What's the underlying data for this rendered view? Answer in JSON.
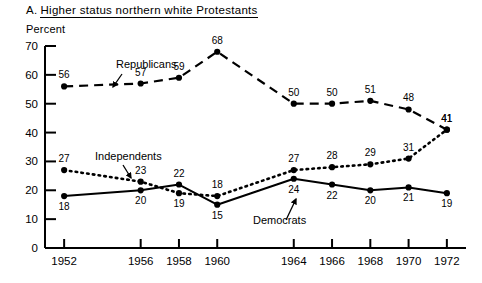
{
  "title": {
    "prefix": "A.",
    "text": "Higher  status northern white Protestants"
  },
  "axis_label_y": "Percent",
  "chart_data": {
    "type": "line",
    "xlabel": "",
    "ylabel": "Percent",
    "ylim": [
      0,
      70
    ],
    "ytick_values": [
      0,
      10,
      20,
      30,
      40,
      50,
      60,
      70
    ],
    "ytick_labels": [
      "0",
      "10",
      "20",
      "30",
      "40",
      "50",
      "60",
      "70"
    ],
    "grid": false,
    "legend_position": "inline-annotations",
    "x": [
      1952,
      1956,
      1958,
      1960,
      1964,
      1966,
      1968,
      1970,
      1972
    ],
    "categories": [
      "1952",
      "1956",
      "1958",
      "1960",
      "1964",
      "1966",
      "1968",
      "1970",
      "1972"
    ],
    "xlim": [
      1951,
      1973
    ],
    "series": [
      {
        "name": "Republicans",
        "style": "dashed",
        "color": "#000000",
        "values": [
          56,
          57,
          59,
          68,
          50,
          50,
          51,
          48,
          41
        ],
        "labels": [
          "56",
          "57",
          "59",
          "68",
          "50",
          "50",
          "51",
          "48",
          "41"
        ],
        "label_positions": [
          "above",
          "above",
          "above",
          "above",
          "above",
          "above",
          "above",
          "above",
          "above"
        ]
      },
      {
        "name": "Independents",
        "style": "dotted",
        "color": "#000000",
        "values": [
          27,
          23,
          19,
          18,
          27,
          28,
          29,
          31,
          41
        ],
        "labels": [
          "27",
          "23",
          "19",
          "18",
          "27",
          "28",
          "29",
          "31",
          "41"
        ],
        "label_positions": [
          "above",
          "above",
          "below",
          "above",
          "above",
          "above",
          "above",
          "above",
          "above"
        ]
      },
      {
        "name": "Democrats",
        "style": "solid",
        "color": "#000000",
        "values": [
          18,
          20,
          22,
          15,
          24,
          22,
          20,
          21,
          19
        ],
        "labels": [
          "18",
          "20",
          "22",
          "15",
          "24",
          "22",
          "20",
          "21",
          "19"
        ],
        "label_positions": [
          "below",
          "below",
          "above",
          "below",
          "below",
          "below",
          "below",
          "below",
          "below"
        ]
      }
    ],
    "annotations": [
      {
        "text": "Republicans",
        "points_to_series": "Republicans"
      },
      {
        "text": "Independents",
        "points_to_series": "Independents"
      },
      {
        "text": "Democrats",
        "points_to_series": "Democrats"
      }
    ]
  }
}
